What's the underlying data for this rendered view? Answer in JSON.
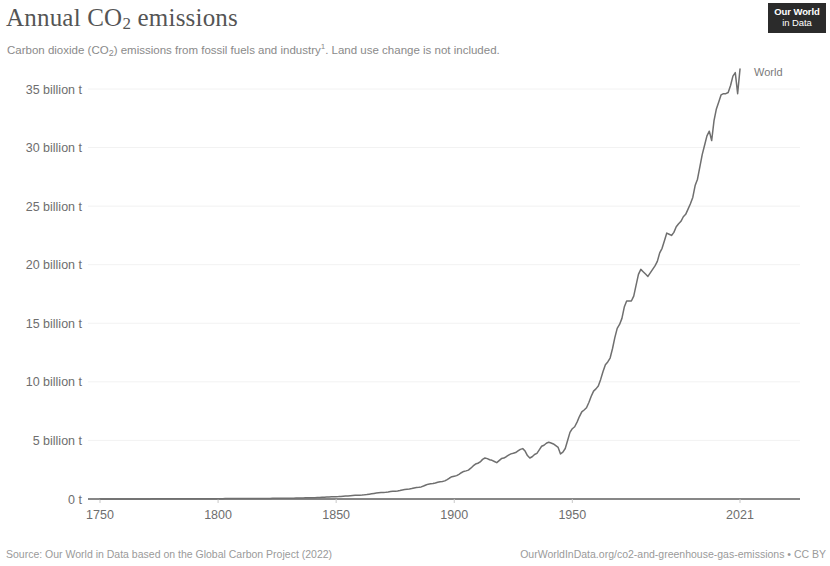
{
  "header": {
    "title_main": "Annual CO",
    "title_sub": "2",
    "title_tail": " emissions",
    "subtitle_a": "Carbon dioxide (CO",
    "subtitle_sub": "2",
    "subtitle_b": ") emissions from fossil fuels and industry",
    "subtitle_note": "1",
    "subtitle_c": ". Land use change is not included."
  },
  "logo": {
    "line1": "Our World",
    "line2": "in Data"
  },
  "footer": {
    "source": "Source: Our World in Data based on the Global Carbon Project (2022)",
    "attribution": "OurWorldInData.org/co2-and-greenhouse-gas-emissions • CC BY"
  },
  "colors": {
    "line": "#6f6f6f",
    "axis": "#5f5f5f",
    "grid": "#f2f2f2",
    "text": "#6e6e6e",
    "title": "#555555",
    "subtitle": "#8a8a8a",
    "logo_bg": "#2b2b2b"
  },
  "chart_data": {
    "type": "line",
    "title": "Annual CO2 emissions",
    "subtitle": "Carbon dioxide (CO2) emissions from fossil fuels and industry. Land use change is not included.",
    "xlabel": "",
    "ylabel": "",
    "unit": "tonnes",
    "grid": true,
    "legend_position": "right-end-label",
    "xlim": [
      1750,
      2021
    ],
    "ylim": [
      0,
      37500000000
    ],
    "x_ticks": [
      1750,
      1800,
      1850,
      1900,
      1950,
      2021
    ],
    "x_tick_labels": [
      "1750",
      "1800",
      "1850",
      "1900",
      "1950",
      "2021"
    ],
    "y_ticks": [
      0,
      5000000000,
      10000000000,
      15000000000,
      20000000000,
      25000000000,
      30000000000,
      35000000000
    ],
    "y_tick_labels": [
      "0 t",
      "5 billion t",
      "10 billion t",
      "15 billion t",
      "20 billion t",
      "25 billion t",
      "30 billion t",
      "35 billion t"
    ],
    "series": [
      {
        "name": "World",
        "color": "#6f6f6f",
        "x": [
          1750,
          1760,
          1770,
          1780,
          1790,
          1800,
          1810,
          1820,
          1830,
          1840,
          1850,
          1860,
          1870,
          1875,
          1880,
          1885,
          1890,
          1895,
          1900,
          1905,
          1910,
          1913,
          1916,
          1918,
          1920,
          1925,
          1929,
          1932,
          1935,
          1937,
          1940,
          1942,
          1944,
          1945,
          1946,
          1950,
          1955,
          1960,
          1965,
          1970,
          1973,
          1975,
          1979,
          1980,
          1982,
          1983,
          1985,
          1988,
          1990,
          1992,
          1995,
          1998,
          2000,
          2003,
          2005,
          2007,
          2008,
          2009,
          2010,
          2011,
          2012,
          2013,
          2014,
          2015,
          2016,
          2017,
          2018,
          2019,
          2020,
          2021
        ],
        "y_billion_t": [
          0.01,
          0.01,
          0.01,
          0.02,
          0.02,
          0.03,
          0.04,
          0.05,
          0.07,
          0.11,
          0.2,
          0.33,
          0.56,
          0.67,
          0.83,
          1.0,
          1.3,
          1.5,
          1.95,
          2.4,
          3.05,
          3.5,
          3.3,
          3.1,
          3.45,
          3.9,
          4.3,
          3.5,
          3.9,
          4.5,
          4.85,
          4.7,
          4.4,
          3.85,
          4.0,
          6.0,
          7.6,
          9.4,
          11.7,
          14.9,
          16.9,
          16.9,
          19.6,
          19.4,
          19.0,
          19.3,
          19.9,
          21.4,
          22.7,
          22.5,
          23.5,
          24.3,
          25.2,
          27.3,
          29.4,
          31.0,
          31.4,
          30.6,
          32.3,
          33.3,
          33.9,
          34.5,
          34.6,
          34.6,
          34.7,
          35.3,
          36.1,
          36.4,
          34.6,
          36.7
        ]
      }
    ],
    "end_label": {
      "text": "World",
      "x": 2021,
      "y_billion_t": 36.7
    },
    "annotations": []
  }
}
